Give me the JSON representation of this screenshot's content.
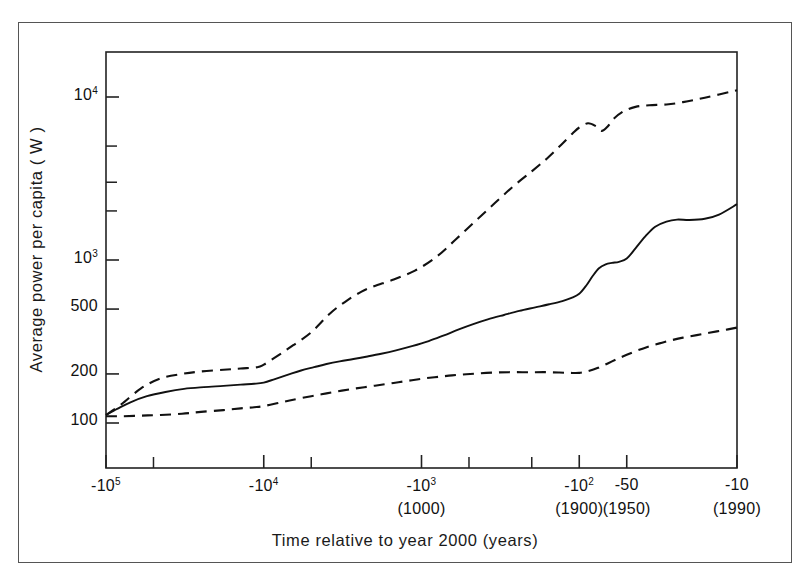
{
  "chart_data": {
    "type": "line",
    "title": "",
    "xlabel": "Time relative to year 2000 (years)",
    "ylabel": "Average power per capita ( W )",
    "xscale": "negative-log",
    "yscale": "log",
    "ylim": [
      60,
      20000
    ],
    "grid": false,
    "legend": null,
    "y_ticks": [
      {
        "value": 10000,
        "label": "10",
        "exp": "4"
      },
      {
        "value": 1000,
        "label": "10",
        "exp": "3"
      },
      {
        "value": 500,
        "label": "500",
        "exp": ""
      },
      {
        "value": 200,
        "label": "200",
        "exp": ""
      },
      {
        "value": 100,
        "label": "100",
        "exp": ""
      }
    ],
    "y_minor_ticks": [
      5000,
      3000,
      2000
    ],
    "x_ticks": [
      {
        "value": -100000,
        "label": "-10",
        "exp": "5",
        "year": ""
      },
      {
        "value": -10000,
        "label": "-10",
        "exp": "4",
        "year": ""
      },
      {
        "value": -1000,
        "label": "-10",
        "exp": "3",
        "year": "(1000)"
      },
      {
        "value": -100,
        "label": "-10",
        "exp": "2",
        "year": "(1900)"
      },
      {
        "value": -50,
        "label": "-50",
        "exp": "",
        "year": "(1950)"
      },
      {
        "value": -10,
        "label": "-10",
        "exp": "",
        "year": "(1990)"
      }
    ],
    "x_minor_ticks": [
      -50000,
      -5000,
      -500,
      -200
    ],
    "series": [
      {
        "name": "upper-bound",
        "style": "dashed",
        "color": "#111111",
        "points": [
          [
            -100000,
            112
          ],
          [
            -80000,
            130
          ],
          [
            -60000,
            163
          ],
          [
            -45000,
            188
          ],
          [
            -33000,
            200
          ],
          [
            -25000,
            207
          ],
          [
            -18000,
            212
          ],
          [
            -14000,
            216
          ],
          [
            -11000,
            220
          ],
          [
            -10000,
            228
          ],
          [
            -8000,
            262
          ],
          [
            -6500,
            300
          ],
          [
            -5000,
            360
          ],
          [
            -3800,
            470
          ],
          [
            -3000,
            560
          ],
          [
            -2400,
            640
          ],
          [
            -2000,
            690
          ],
          [
            -1500,
            760
          ],
          [
            -1100,
            860
          ],
          [
            -800,
            1050
          ],
          [
            -600,
            1350
          ],
          [
            -450,
            1750
          ],
          [
            -340,
            2250
          ],
          [
            -260,
            2850
          ],
          [
            -200,
            3500
          ],
          [
            -160,
            4200
          ],
          [
            -130,
            5100
          ],
          [
            -110,
            6000
          ],
          [
            -100,
            6500
          ],
          [
            -88,
            6900
          ],
          [
            -78,
            6600
          ],
          [
            -72,
            6200
          ],
          [
            -66,
            6600
          ],
          [
            -60,
            7400
          ],
          [
            -52,
            8200
          ],
          [
            -44,
            8700
          ],
          [
            -36,
            8900
          ],
          [
            -28,
            9000
          ],
          [
            -22,
            9300
          ],
          [
            -16,
            9900
          ],
          [
            -10,
            11000
          ]
        ]
      },
      {
        "name": "best-estimate",
        "style": "solid",
        "color": "#111111",
        "points": [
          [
            -100000,
            112
          ],
          [
            -85000,
            122
          ],
          [
            -70000,
            134
          ],
          [
            -55000,
            146
          ],
          [
            -42000,
            155
          ],
          [
            -32000,
            162
          ],
          [
            -24000,
            166
          ],
          [
            -18000,
            169
          ],
          [
            -14000,
            172
          ],
          [
            -11500,
            174
          ],
          [
            -10000,
            177
          ],
          [
            -8500,
            186
          ],
          [
            -7000,
            198
          ],
          [
            -5800,
            210
          ],
          [
            -4800,
            220
          ],
          [
            -4000,
            230
          ],
          [
            -3300,
            239
          ],
          [
            -2700,
            247
          ],
          [
            -2200,
            256
          ],
          [
            -1800,
            266
          ],
          [
            -1450,
            279
          ],
          [
            -1150,
            296
          ],
          [
            -900,
            318
          ],
          [
            -720,
            345
          ],
          [
            -580,
            375
          ],
          [
            -470,
            404
          ],
          [
            -380,
            432
          ],
          [
            -300,
            460
          ],
          [
            -240,
            487
          ],
          [
            -190,
            512
          ],
          [
            -155,
            535
          ],
          [
            -128,
            560
          ],
          [
            -112,
            585
          ],
          [
            -100,
            620
          ],
          [
            -90,
            700
          ],
          [
            -82,
            800
          ],
          [
            -75,
            890
          ],
          [
            -68,
            940
          ],
          [
            -62,
            960
          ],
          [
            -56,
            975
          ],
          [
            -50,
            1020
          ],
          [
            -44,
            1180
          ],
          [
            -38,
            1400
          ],
          [
            -33,
            1600
          ],
          [
            -28,
            1720
          ],
          [
            -24,
            1770
          ],
          [
            -20,
            1760
          ],
          [
            -16,
            1790
          ],
          [
            -13,
            1900
          ],
          [
            -10,
            2200
          ]
        ]
      },
      {
        "name": "lower-bound",
        "style": "dashed",
        "color": "#111111",
        "points": [
          [
            -100000,
            110
          ],
          [
            -80000,
            110
          ],
          [
            -60000,
            111
          ],
          [
            -45000,
            112
          ],
          [
            -33000,
            114
          ],
          [
            -25000,
            117
          ],
          [
            -18000,
            120
          ],
          [
            -14000,
            123
          ],
          [
            -11500,
            125
          ],
          [
            -10000,
            127
          ],
          [
            -8000,
            133
          ],
          [
            -6500,
            139
          ],
          [
            -5000,
            146
          ],
          [
            -4000,
            152
          ],
          [
            -3200,
            158
          ],
          [
            -2600,
            163
          ],
          [
            -2100,
            168
          ],
          [
            -1700,
            173
          ],
          [
            -1400,
            178
          ],
          [
            -1150,
            183
          ],
          [
            -950,
            188
          ],
          [
            -780,
            192
          ],
          [
            -640,
            196
          ],
          [
            -520,
            199
          ],
          [
            -420,
            202
          ],
          [
            -340,
            204
          ],
          [
            -280,
            205
          ],
          [
            -230,
            205
          ],
          [
            -190,
            205
          ],
          [
            -160,
            205
          ],
          [
            -135,
            204
          ],
          [
            -115,
            203
          ],
          [
            -100,
            203
          ],
          [
            -88,
            208
          ],
          [
            -76,
            218
          ],
          [
            -66,
            232
          ],
          [
            -57,
            248
          ],
          [
            -50,
            262
          ],
          [
            -43,
            278
          ],
          [
            -37,
            293
          ],
          [
            -31,
            308
          ],
          [
            -26,
            322
          ],
          [
            -22,
            334
          ],
          [
            -18,
            346
          ],
          [
            -15,
            358
          ],
          [
            -12,
            372
          ],
          [
            -10,
            385
          ]
        ]
      }
    ]
  },
  "axis_titles": {
    "y": "Average power per capita ( W )",
    "x": "Time relative to year 2000 (years)"
  }
}
